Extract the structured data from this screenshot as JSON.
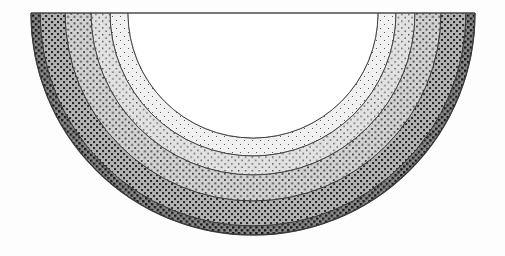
{
  "figure": {
    "type": "concentric-half-annulus-zone-diagram",
    "shape": "semicircle",
    "orientation": "downward",
    "background_color": "#fdfdfd",
    "outline_color": "#3a3a3a",
    "diameter_line_color": "#4a4a4a",
    "center": {
      "x": 253,
      "y": 13
    },
    "core": {
      "name": "inner-core",
      "fill_color": "#ffffff",
      "pattern": "none",
      "radius": 125
    },
    "bands": [
      {
        "index": 1,
        "name": "band-innermost",
        "label": "Zone 1",
        "fill_color": "#f0f0f0",
        "dot_color": "#585858",
        "pattern": "sparse-dot",
        "dot_size": 1.0,
        "dot_spacing": 4.0,
        "inner_radius": 125,
        "outer_radius": 143
      },
      {
        "index": 2,
        "name": "band-inner",
        "label": "Zone 2",
        "fill_color": "#e2e2e2",
        "dot_color": "#4a4a4a",
        "pattern": "light-checker",
        "dot_size": 1.4,
        "dot_spacing": 3.4,
        "inner_radius": 143,
        "outer_radius": 162
      },
      {
        "index": 3,
        "name": "band-middle",
        "label": "Zone 3",
        "fill_color": "#d2d2d2",
        "dot_color": "#3c3c3c",
        "pattern": "medium-checker",
        "dot_size": 1.8,
        "dot_spacing": 3.2,
        "inner_radius": 162,
        "outer_radius": 188
      },
      {
        "index": 4,
        "name": "band-outer",
        "label": "Zone 4",
        "fill_color": "#b4b4b4",
        "dot_color": "#2a2a2a",
        "pattern": "dense-checker",
        "dot_size": 2.1,
        "dot_spacing": 3.0,
        "inner_radius": 188,
        "outer_radius": 213
      },
      {
        "index": 5,
        "name": "band-outermost",
        "label": "Zone 5",
        "fill_color": "#8c8c8c",
        "dot_color": "#151515",
        "pattern": "darkest-checker",
        "dot_size": 2.4,
        "dot_spacing": 2.9,
        "inner_radius": 213,
        "outer_radius": 222
      }
    ],
    "extent": {
      "left_edge_x": 31,
      "right_edge_x": 475,
      "top_edge_y": 13,
      "bottom_edge_y": 246
    }
  }
}
